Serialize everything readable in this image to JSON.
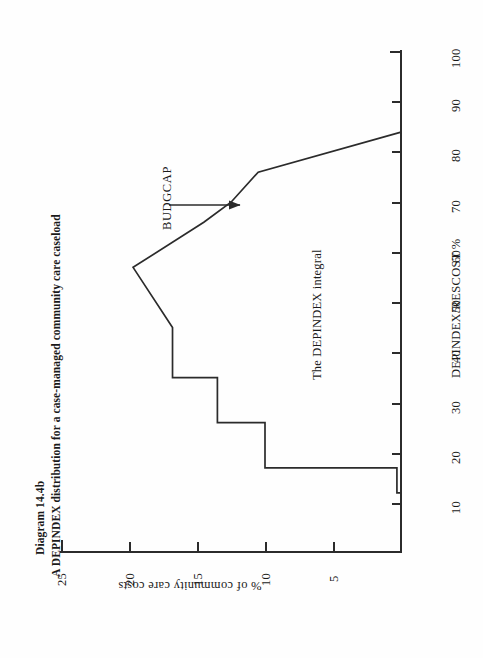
{
  "figure": {
    "number": "Diagram 14.4b",
    "caption": "A DEPINDEX distribution for a case-managed community care caseload"
  },
  "annotations": {
    "budgcap": "BUDGCAP",
    "integral": "The DEPINDEX integral",
    "arrow": "arrow-right-icon"
  },
  "chart_data": {
    "type": "line",
    "title": "A DEPINDEX distribution for a case-managed community care caseload",
    "subtitle": "Diagram 14.4b",
    "orientation": "rotated-90-ccw",
    "grid": false,
    "legend": "none",
    "xlabel": "DEPINDEX/RESCOST %",
    "ylabel": "% of community care costs",
    "xlim": [
      5,
      100
    ],
    "ylim": [
      0,
      25
    ],
    "xticks": [
      10,
      20,
      30,
      40,
      50,
      60,
      70,
      80,
      90,
      100
    ],
    "xticklabels": [
      "10",
      "20",
      "30",
      "40",
      "50",
      "60",
      "70",
      "80",
      "90",
      "100"
    ],
    "yticks": [
      0,
      5,
      10,
      15,
      20,
      25
    ],
    "yticklabels": [
      "",
      "5",
      "10",
      "15",
      "20",
      "25"
    ],
    "x": [
      12,
      12,
      17,
      17,
      26,
      26,
      35,
      35,
      45,
      57,
      66,
      70,
      76,
      84
    ],
    "y": [
      0,
      0.3,
      0.3,
      10,
      10,
      13.5,
      13.5,
      16.8,
      16.8,
      19.7,
      14.5,
      12.5,
      10.5,
      0
    ],
    "points": [
      {
        "x": 12,
        "y": 0.0,
        "note": "baseline start"
      },
      {
        "x": 12,
        "y": 0.3,
        "note": "lower tail"
      },
      {
        "x": 17,
        "y": 0.3,
        "note": "step riser base"
      },
      {
        "x": 17,
        "y": 10.0,
        "note": "step up to 10%"
      },
      {
        "x": 26,
        "y": 10.0,
        "note": "step top right"
      },
      {
        "x": 26,
        "y": 13.5,
        "note": "rise"
      },
      {
        "x": 35,
        "y": 13.5,
        "note": "plateau"
      },
      {
        "x": 35,
        "y": 16.8,
        "note": "riser to 16.8%"
      },
      {
        "x": 45,
        "y": 16.8,
        "note": "plateau shoulder"
      },
      {
        "x": 57,
        "y": 19.7,
        "note": "peak / mode"
      },
      {
        "x": 66,
        "y": 14.5,
        "note": "descent"
      },
      {
        "x": 70,
        "y": 12.5,
        "note": "BUDGCAP step base"
      },
      {
        "x": 76,
        "y": 10.5,
        "note": "BUDGCAP step top"
      },
      {
        "x": 84,
        "y": 0.0,
        "note": "upper tail to baseline"
      }
    ],
    "annotations": [
      {
        "text": "BUDGCAP",
        "target_x": 72,
        "target_y": 11.8,
        "arrow": true
      },
      {
        "text": "The DEPINDEX integral",
        "x": 45,
        "y": 5.5,
        "arrow": false
      }
    ]
  },
  "colors": {
    "ink": "#2b2b2b",
    "paper": "#fefefe"
  }
}
